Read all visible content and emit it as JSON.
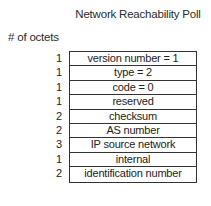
{
  "title": "Network Reachability Poll",
  "octets_label": "# of octets",
  "fields": [
    {
      "octets": "1",
      "name": "version number = 1"
    },
    {
      "octets": "1",
      "name": "type = 2"
    },
    {
      "octets": "1",
      "name": "code = 0"
    },
    {
      "octets": "1",
      "name": "reserved"
    },
    {
      "octets": "2",
      "name": "checksum"
    },
    {
      "octets": "2",
      "name": "AS number"
    },
    {
      "octets": "3",
      "name": "IP source network"
    },
    {
      "octets": "1",
      "name": "internal"
    },
    {
      "octets": "2",
      "name": "identification number"
    }
  ]
}
